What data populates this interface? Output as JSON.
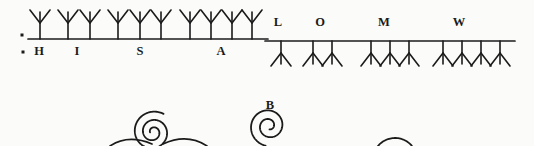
{
  "figure": {
    "ink": "#1b1b1b",
    "background": "#fbfbf9",
    "left_section": {
      "direction": "up",
      "line": {
        "x1": 28,
        "x2": 268,
        "y": 39
      },
      "dots": [
        {
          "x": 20.5,
          "y": 33.5
        },
        {
          "x": 21.5,
          "y": 50.5
        }
      ],
      "groups": [
        {
          "label": "H",
          "label_x": 39,
          "label_y": 44.5,
          "stems": [
            40
          ]
        },
        {
          "label": "I",
          "label_x": 77,
          "label_y": 44.5,
          "stems": [
            68,
            90
          ]
        },
        {
          "label": "S",
          "label_x": 140,
          "label_y": 44.5,
          "stems": [
            118,
            140,
            161
          ]
        },
        {
          "label": "A",
          "label_x": 221,
          "label_y": 44.5,
          "stems": [
            190,
            211,
            232,
            252
          ]
        }
      ]
    },
    "right_section": {
      "direction": "down",
      "line": {
        "x1": 265,
        "x2": 515,
        "y": 41
      },
      "dots": [],
      "groups": [
        {
          "label": "L",
          "label_x": 278,
          "label_y": 15.5,
          "stems": [
            281
          ]
        },
        {
          "label": "O",
          "label_x": 320,
          "label_y": 15.5,
          "stems": [
            313,
            332
          ]
        },
        {
          "label": "M",
          "label_x": 384,
          "label_y": 15.5,
          "stems": [
            371,
            390,
            409
          ]
        },
        {
          "label": "W",
          "label_x": 459,
          "label_y": 15.5,
          "stems": [
            443,
            462,
            481,
            500
          ]
        }
      ]
    },
    "glyph": {
      "stem_up": 16,
      "stem_down": 12,
      "arm_dx": 10,
      "arm_dy": 13,
      "prong": 11,
      "stroke": 1.6
    },
    "spirals": [
      {
        "name": "left-spiral",
        "label": "",
        "label_x": 153,
        "label_y": 99,
        "cx": 153,
        "cy": 132,
        "r_out": 21,
        "r_in": 3,
        "start_deg": 300,
        "turns": 2.35,
        "dir": -1
      },
      {
        "name": "center-spiral",
        "label": "B",
        "label_x": 270,
        "label_y": 99,
        "cx": 269,
        "cy": 126,
        "r_out": 20,
        "r_in": 3.5,
        "start_deg": 100,
        "turns": 1.95,
        "dir": 1
      },
      {
        "name": "right-arc",
        "label": "",
        "label_x": 395,
        "label_y": 99,
        "cx": 395,
        "cy": 160,
        "r_out": 22,
        "r_in": 22,
        "start_deg": 219,
        "turns": 0.28,
        "dir": 1
      }
    ],
    "base_curves": [
      "M110,146 Q128,134 152,144",
      "M163,144 Q187,133 207,146"
    ]
  }
}
